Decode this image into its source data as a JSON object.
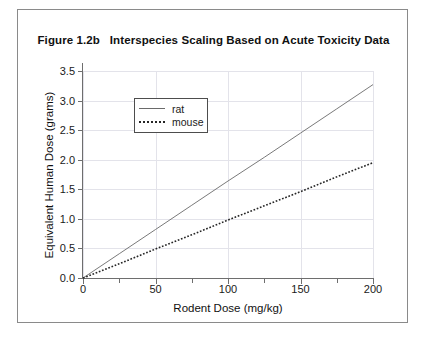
{
  "figure": {
    "title": "Figure 1.2b   Interspecies Scaling Based on Acute Toxicity Data"
  },
  "chart_data": {
    "type": "line",
    "title": "Figure 1.2b   Interspecies Scaling Based on Acute Toxicity Data",
    "xlabel": "Rodent Dose (mg/kg)",
    "ylabel": "Equivalent Human Dose (grams)",
    "xlim": [
      0,
      200
    ],
    "ylim": [
      0.0,
      3.5
    ],
    "xticks": [
      0,
      50,
      100,
      150,
      200
    ],
    "xtick_labels": [
      "0",
      "50",
      "100",
      "150",
      "200"
    ],
    "xticks_minor": [
      25,
      75,
      125,
      175
    ],
    "yticks": [
      0.0,
      0.5,
      1.0,
      1.5,
      2.0,
      2.5,
      3.0,
      3.5
    ],
    "ytick_labels": [
      "0.0",
      "0.5",
      "1.0",
      "1.5",
      "2.0",
      "2.5",
      "3.0",
      "3.5"
    ],
    "grid": true,
    "legend_position": "upper-left-inside",
    "x": [
      0,
      25,
      50,
      75,
      100,
      125,
      150,
      175,
      200
    ],
    "series": [
      {
        "name": "rat",
        "style": "solid",
        "color": "#6a6a6a",
        "values": [
          0.0,
          0.41,
          0.82,
          1.23,
          1.64,
          2.04,
          2.45,
          2.86,
          3.27
        ]
      },
      {
        "name": "mouse",
        "style": "dotted",
        "color": "#262626",
        "values": [
          0.0,
          0.24,
          0.49,
          0.73,
          0.98,
          1.22,
          1.46,
          1.71,
          1.95
        ]
      }
    ]
  },
  "legend": {
    "entries": [
      {
        "label": "rat"
      },
      {
        "label": "mouse"
      }
    ]
  },
  "colors": {
    "frame": "#8a8a8a",
    "axis": "#6e6e6e",
    "grid": "#e3e3ea",
    "rat": "#6a6a6a",
    "mouse": "#262626"
  }
}
